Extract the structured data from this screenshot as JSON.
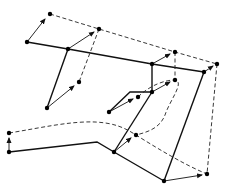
{
  "diagram": {
    "colors": {
      "line": "#111111",
      "background": "#ffffff"
    },
    "nodes": [
      {
        "id": "n1",
        "x": 27,
        "y": 42
      },
      {
        "id": "n2",
        "x": 68,
        "y": 49
      },
      {
        "id": "n3",
        "x": 47,
        "y": 108
      },
      {
        "id": "n4",
        "x": 152,
        "y": 64
      },
      {
        "id": "n5",
        "x": 204,
        "y": 72
      },
      {
        "id": "n6",
        "x": 152,
        "y": 92
      },
      {
        "id": "n7",
        "x": 109,
        "y": 112
      },
      {
        "id": "n8",
        "x": 9,
        "y": 152
      },
      {
        "id": "n9",
        "x": 114,
        "y": 152
      },
      {
        "id": "n10",
        "x": 164,
        "y": 181
      }
    ],
    "displaced_nodes": [
      {
        "id": "d1",
        "x": 50,
        "y": 14
      },
      {
        "id": "d2",
        "x": 99,
        "y": 29
      },
      {
        "id": "d3",
        "x": 79,
        "y": 82
      },
      {
        "id": "d4",
        "x": 175,
        "y": 52
      },
      {
        "id": "d5",
        "x": 217,
        "y": 64
      },
      {
        "id": "d6",
        "x": 175,
        "y": 80
      },
      {
        "id": "d7",
        "x": 138,
        "y": 97
      },
      {
        "id": "d8",
        "x": 9,
        "y": 133
      },
      {
        "id": "d9",
        "x": 136,
        "y": 135
      },
      {
        "id": "d10",
        "x": 207,
        "y": 174
      }
    ]
  }
}
